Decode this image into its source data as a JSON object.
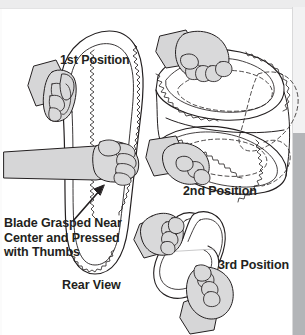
{
  "figure": {
    "kind": "instructional-diagram",
    "ink_color": "#231f20",
    "fill_color": "#d7d7d8",
    "hand_fill": "#d9d9da",
    "background": "#ffffff",
    "page_edge_gray": "#b3b5b8"
  },
  "captions": {
    "first_position": "1st Position",
    "second_position": "2nd Position",
    "third_position": "3rd Position",
    "rear_view": "Rear View",
    "blade_note_line1": "Blade Grasped Near",
    "blade_note_line2": "Center and Pressed",
    "blade_note_line3": "with Thumbs"
  },
  "annotations": {
    "arrow": "arrow pointing up-right from blade note toward blade center"
  }
}
